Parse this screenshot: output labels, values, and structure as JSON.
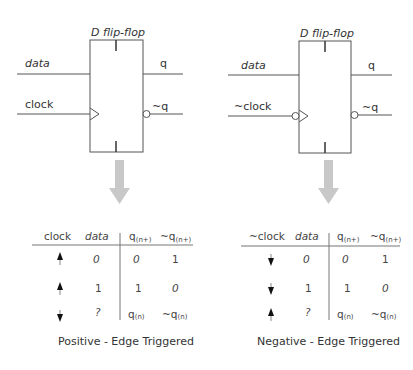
{
  "left": {
    "title": "D flip-flop",
    "inputs": {
      "data": "data",
      "clock": "clock"
    },
    "outputs": {
      "q": "q",
      "nq": "~q"
    },
    "clock_inverted": false,
    "table": {
      "headers": [
        "clock",
        "data",
        "q",
        "~q"
      ],
      "header_subscripts": [
        "",
        "",
        "(n+)",
        "(n+)"
      ],
      "rows": [
        {
          "clock": "rising",
          "data": "0",
          "q": "0",
          "nq": "1"
        },
        {
          "clock": "rising",
          "data": "1",
          "q": "1",
          "nq": "0"
        },
        {
          "clock": "falling",
          "data": "?",
          "q": "q",
          "q_sub": "(n)",
          "nq": "~q",
          "nq_sub": "(n)"
        }
      ]
    },
    "caption": "Positive - Edge Triggered"
  },
  "right": {
    "title": "D flip-flop",
    "inputs": {
      "data": "data",
      "clock": "~clock"
    },
    "outputs": {
      "q": "q",
      "nq": "~q"
    },
    "clock_inverted": true,
    "table": {
      "headers": [
        "~clock",
        "data",
        "q",
        "~q"
      ],
      "header_subscripts": [
        "",
        "",
        "(n+)",
        "(n+)"
      ],
      "rows": [
        {
          "clock": "falling",
          "data": "0",
          "q": "0",
          "nq": "1"
        },
        {
          "clock": "falling",
          "data": "1",
          "q": "1",
          "nq": "0"
        },
        {
          "clock": "rising",
          "data": "?",
          "q": "q",
          "q_sub": "(n)",
          "nq": "~q",
          "nq_sub": "(n)"
        }
      ]
    },
    "caption": "Negative - Edge Triggered"
  },
  "colors": {
    "line": "#555555",
    "arrow": "#c8c8c8",
    "text": "#333333"
  }
}
